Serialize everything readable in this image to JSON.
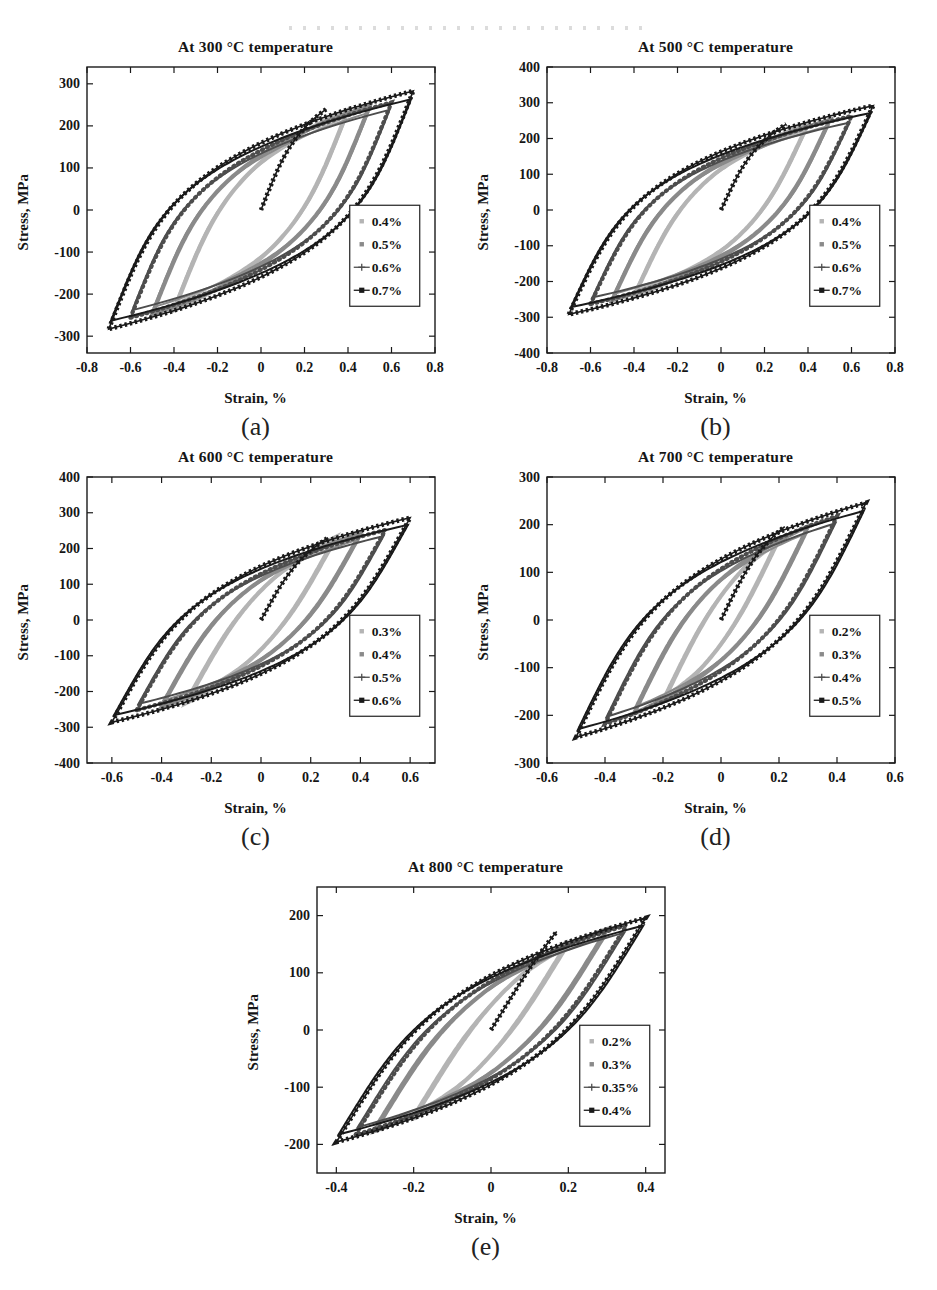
{
  "page": {
    "background": "#ffffff",
    "text_color": "#111111"
  },
  "chart_data": [
    {
      "id": "a",
      "type": "line",
      "title": "At 300 °C temperature",
      "xlabel": "Strain, %",
      "ylabel": "Stress, MPa",
      "caption": "(a)",
      "xlim": [
        -0.8,
        0.8
      ],
      "ylim": [
        -340,
        340
      ],
      "xticks": [
        "-0.8",
        "-0.6",
        "-0.4",
        "-0.2",
        "0",
        "0.2",
        "0.4",
        "0.6",
        "0.8"
      ],
      "yticks": [
        "-300",
        "-200",
        "-100",
        "0",
        "100",
        "200",
        "300"
      ],
      "grid": false,
      "legend_position": "right-center",
      "series": [
        {
          "name": "0.4%",
          "strain_amplitude_pct": 0.4,
          "peak_stress_mpa": 238,
          "color": "#b4b4b4",
          "style": "dot"
        },
        {
          "name": "0.5%",
          "strain_amplitude_pct": 0.5,
          "peak_stress_mpa": 248,
          "color": "#8a8a8a",
          "style": "dot"
        },
        {
          "name": "0.6%",
          "strain_amplitude_pct": 0.6,
          "peak_stress_mpa": 256,
          "color": "#4d4d4d",
          "style": "plus-line"
        },
        {
          "name": "0.7%",
          "strain_amplitude_pct": 0.7,
          "peak_stress_mpa": 283,
          "color": "#1a1a1a",
          "style": "square-line"
        }
      ],
      "loop_shape": {
        "elastic_modulus_mpa_per_pct": 1300,
        "hardening_exponent": 4
      },
      "initial_curve": {
        "end_strain_pct": 0.3,
        "end_stress_mpa": 240
      }
    },
    {
      "id": "b",
      "type": "line",
      "title": "At 500 °C temperature",
      "xlabel": "Strain, %",
      "ylabel": "Stress, MPa",
      "caption": "(b)",
      "xlim": [
        -0.8,
        0.8
      ],
      "ylim": [
        -400,
        400
      ],
      "xticks": [
        "-0.8",
        "-0.6",
        "-0.4",
        "-0.2",
        "0",
        "0.2",
        "0.4",
        "0.6",
        "0.8"
      ],
      "yticks": [
        "-400",
        "-300",
        "-200",
        "-100",
        "0",
        "100",
        "200",
        "300",
        "400"
      ],
      "grid": false,
      "legend_position": "right-center",
      "series": [
        {
          "name": "0.4%",
          "strain_amplitude_pct": 0.4,
          "peak_stress_mpa": 242,
          "color": "#b4b4b4",
          "style": "dot"
        },
        {
          "name": "0.5%",
          "strain_amplitude_pct": 0.5,
          "peak_stress_mpa": 252,
          "color": "#8a8a8a",
          "style": "dot"
        },
        {
          "name": "0.6%",
          "strain_amplitude_pct": 0.6,
          "peak_stress_mpa": 263,
          "color": "#4d4d4d",
          "style": "plus-line"
        },
        {
          "name": "0.7%",
          "strain_amplitude_pct": 0.7,
          "peak_stress_mpa": 292,
          "color": "#1a1a1a",
          "style": "square-line"
        }
      ],
      "loop_shape": {
        "elastic_modulus_mpa_per_pct": 1300,
        "hardening_exponent": 4
      },
      "initial_curve": {
        "end_strain_pct": 0.3,
        "end_stress_mpa": 240
      }
    },
    {
      "id": "c",
      "type": "line",
      "title": "At 600 °C temperature",
      "xlabel": "Strain, %",
      "ylabel": "Stress, MPa",
      "caption": "(c)",
      "xlim": [
        -0.7,
        0.7
      ],
      "ylim": [
        -400,
        400
      ],
      "xticks": [
        "-0.6",
        "-0.4",
        "-0.2",
        "0",
        "0.2",
        "0.4",
        "0.6"
      ],
      "yticks": [
        "-400",
        "-300",
        "-200",
        "-100",
        "0",
        "100",
        "200",
        "300",
        "400"
      ],
      "grid": false,
      "legend_position": "right-center",
      "series": [
        {
          "name": "0.3%",
          "strain_amplitude_pct": 0.3,
          "peak_stress_mpa": 232,
          "color": "#b4b4b4",
          "style": "dot"
        },
        {
          "name": "0.4%",
          "strain_amplitude_pct": 0.4,
          "peak_stress_mpa": 243,
          "color": "#8a8a8a",
          "style": "dot"
        },
        {
          "name": "0.5%",
          "strain_amplitude_pct": 0.5,
          "peak_stress_mpa": 252,
          "color": "#4d4d4d",
          "style": "plus-line"
        },
        {
          "name": "0.6%",
          "strain_amplitude_pct": 0.6,
          "peak_stress_mpa": 286,
          "color": "#1a1a1a",
          "style": "square-line"
        }
      ],
      "loop_shape": {
        "elastic_modulus_mpa_per_pct": 1250,
        "hardening_exponent": 4
      },
      "initial_curve": {
        "end_strain_pct": 0.27,
        "end_stress_mpa": 230
      }
    },
    {
      "id": "d",
      "type": "line",
      "title": "At 700 °C temperature",
      "xlabel": "Strain, %",
      "ylabel": "Stress, MPa",
      "caption": "(d)",
      "xlim": [
        -0.6,
        0.6
      ],
      "ylim": [
        -300,
        300
      ],
      "xticks": [
        "-0.6",
        "-0.4",
        "-0.2",
        "0",
        "0.2",
        "0.4",
        "0.6"
      ],
      "yticks": [
        "-300",
        "-200",
        "-100",
        "0",
        "100",
        "200",
        "300"
      ],
      "grid": false,
      "legend_position": "right-center",
      "series": [
        {
          "name": "0.2%",
          "strain_amplitude_pct": 0.2,
          "peak_stress_mpa": 172,
          "color": "#b4b4b4",
          "style": "dot"
        },
        {
          "name": "0.3%",
          "strain_amplitude_pct": 0.3,
          "peak_stress_mpa": 196,
          "color": "#8a8a8a",
          "style": "dot"
        },
        {
          "name": "0.4%",
          "strain_amplitude_pct": 0.4,
          "peak_stress_mpa": 218,
          "color": "#4d4d4d",
          "style": "plus-line"
        },
        {
          "name": "0.5%",
          "strain_amplitude_pct": 0.5,
          "peak_stress_mpa": 246,
          "color": "#1a1a1a",
          "style": "square-line"
        }
      ],
      "loop_shape": {
        "elastic_modulus_mpa_per_pct": 1250,
        "hardening_exponent": 4
      },
      "initial_curve": {
        "end_strain_pct": 0.22,
        "end_stress_mpa": 196
      }
    },
    {
      "id": "e",
      "type": "line",
      "title": "At 800 °C temperature",
      "xlabel": "Strain, %",
      "ylabel": "Stress, MPa",
      "caption": "(e)",
      "xlim": [
        -0.45,
        0.45
      ],
      "ylim": [
        -250,
        250
      ],
      "xticks": [
        "-0.4",
        "-0.2",
        "0",
        "0.2",
        "0.4"
      ],
      "yticks": [
        "-200",
        "-100",
        "0",
        "100",
        "200"
      ],
      "grid": false,
      "legend_position": "right-center",
      "series": [
        {
          "name": "0.2%",
          "strain_amplitude_pct": 0.2,
          "peak_stress_mpa": 155,
          "color": "#b4b4b4",
          "style": "dot"
        },
        {
          "name": "0.3%",
          "strain_amplitude_pct": 0.3,
          "peak_stress_mpa": 176,
          "color": "#8a8a8a",
          "style": "dot"
        },
        {
          "name": "0.35%",
          "strain_amplitude_pct": 0.35,
          "peak_stress_mpa": 183,
          "color": "#4d4d4d",
          "style": "plus-line"
        },
        {
          "name": "0.4%",
          "strain_amplitude_pct": 0.4,
          "peak_stress_mpa": 196,
          "color": "#1a1a1a",
          "style": "square-line"
        }
      ],
      "loop_shape": {
        "elastic_modulus_mpa_per_pct": 1100,
        "hardening_exponent": 4
      },
      "initial_curve": {
        "end_strain_pct": 0.17,
        "end_stress_mpa": 172
      }
    }
  ]
}
